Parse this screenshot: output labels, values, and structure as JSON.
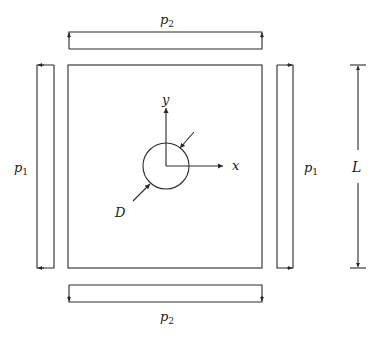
{
  "figure": {
    "plate": {
      "x": 68,
      "y": 65,
      "width": 194,
      "height": 203
    },
    "hole": {
      "cx": 166,
      "cy": 166,
      "r": 23,
      "label": "D"
    },
    "axes": {
      "x_label": "x",
      "y_label": "y"
    },
    "loads": {
      "top": {
        "symbol": "p",
        "subscript": "2"
      },
      "bottom": {
        "symbol": "p",
        "subscript": "2"
      },
      "left": {
        "symbol": "p",
        "subscript": "1"
      },
      "right": {
        "symbol": "p",
        "subscript": "1"
      }
    },
    "dimension": {
      "label": "L"
    },
    "colors": {
      "stroke": "#2a2a2a",
      "background": "#ffffff"
    }
  }
}
